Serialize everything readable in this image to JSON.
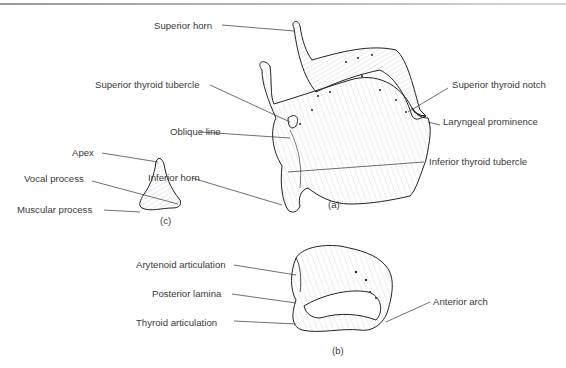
{
  "header": {
    "left_fragment": "…",
    "right_fragment": "…ology"
  },
  "figure_a": {
    "caption": "(a)",
    "title": "Thyroid cartilage",
    "labels": {
      "superior_horn": "Superior horn",
      "superior_thyroid_tubercle": "Superior thyroid tubercle",
      "oblique_line": "Oblique line",
      "inferior_horn": "Inferior horn",
      "superior_thyroid_notch": "Superior thyroid notch",
      "laryngeal_prominence": "Laryngeal prominence",
      "inferior_thyroid_tubercle": "Inferior thyroid tubercle"
    }
  },
  "figure_b": {
    "caption": "(b)",
    "title": "Cricoid cartilage",
    "labels": {
      "arytenoid_articulation": "Arytenoid articulation",
      "posterior_lamina": "Posterior lamina",
      "thyroid_articulation": "Thyroid articulation",
      "anterior_arch": "Anterior arch"
    }
  },
  "figure_c": {
    "caption": "(c)",
    "title": "Arytenoid cartilage",
    "labels": {
      "apex": "Apex",
      "vocal_process": "Vocal process",
      "muscular_process": "Muscular process"
    }
  },
  "colors": {
    "line": "#2a2a2a",
    "text": "#3a3a3a",
    "rule": "#a0a0a0"
  }
}
